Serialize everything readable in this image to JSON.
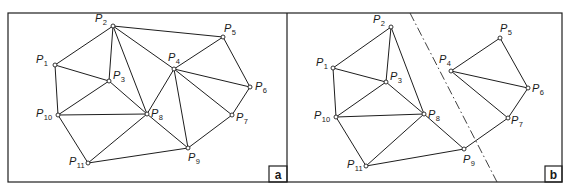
{
  "figure": {
    "colors": {
      "ink": "#1e1e1e",
      "background": "#ffffff"
    },
    "frame": {
      "left": 8,
      "top": 13,
      "right": 562,
      "bottom": 182,
      "divider_x": 287
    },
    "panels": [
      {
        "id": "a",
        "tag": "a",
        "tag_box": {
          "x": 269,
          "y": 166,
          "w": 18,
          "h": 16
        },
        "points": [
          {
            "id": "P1",
            "base": "P",
            "sub": "1",
            "x": 55,
            "y": 65,
            "lx": 36,
            "ly": 63
          },
          {
            "id": "P2",
            "base": "P",
            "sub": "2",
            "x": 113,
            "y": 26,
            "lx": 95,
            "ly": 22
          },
          {
            "id": "P3",
            "base": "P",
            "sub": "3",
            "x": 109,
            "y": 81,
            "lx": 113,
            "ly": 79
          },
          {
            "id": "P4",
            "base": "P",
            "sub": "4",
            "x": 174,
            "y": 69,
            "lx": 168,
            "ly": 61
          },
          {
            "id": "P5",
            "base": "P",
            "sub": "5",
            "x": 223,
            "y": 37,
            "lx": 224,
            "ly": 32
          },
          {
            "id": "P6",
            "base": "P",
            "sub": "6",
            "x": 250,
            "y": 87,
            "lx": 255,
            "ly": 90
          },
          {
            "id": "P7",
            "base": "P",
            "sub": "7",
            "x": 232,
            "y": 115,
            "lx": 236,
            "ly": 121
          },
          {
            "id": "P8",
            "base": "P",
            "sub": "8",
            "x": 147,
            "y": 114,
            "lx": 151,
            "ly": 117
          },
          {
            "id": "P9",
            "base": "P",
            "sub": "9",
            "x": 188,
            "y": 148,
            "lx": 188,
            "ly": 161
          },
          {
            "id": "P10",
            "base": "P",
            "sub": "10",
            "x": 58,
            "y": 115,
            "lx": 36,
            "ly": 117
          },
          {
            "id": "P11",
            "base": "P",
            "sub": "11",
            "x": 88,
            "y": 163,
            "lx": 69,
            "ly": 165
          }
        ],
        "edges": [
          [
            "P1",
            "P2"
          ],
          [
            "P2",
            "P5"
          ],
          [
            "P5",
            "P6"
          ],
          [
            "P6",
            "P7"
          ],
          [
            "P7",
            "P9"
          ],
          [
            "P9",
            "P11"
          ],
          [
            "P11",
            "P10"
          ],
          [
            "P10",
            "P1"
          ],
          [
            "P1",
            "P3"
          ],
          [
            "P2",
            "P3"
          ],
          [
            "P3",
            "P10"
          ],
          [
            "P3",
            "P8"
          ],
          [
            "P2",
            "P8"
          ],
          [
            "P2",
            "P4"
          ],
          [
            "P4",
            "P5"
          ],
          [
            "P4",
            "P6"
          ],
          [
            "P4",
            "P7"
          ],
          [
            "P4",
            "P9"
          ],
          [
            "P4",
            "P8"
          ],
          [
            "P8",
            "P10"
          ],
          [
            "P8",
            "P11"
          ],
          [
            "P8",
            "P9"
          ]
        ]
      },
      {
        "id": "b",
        "tag": "b",
        "tag_box": {
          "x": 545,
          "y": 166,
          "w": 17,
          "h": 16
        },
        "cut_line": {
          "x1": 410,
          "y1": 13,
          "x2": 497,
          "y2": 182
        },
        "points": [
          {
            "id": "P1",
            "base": "P",
            "sub": "1",
            "x": 333,
            "y": 68,
            "lx": 316,
            "ly": 66
          },
          {
            "id": "P2",
            "base": "P",
            "sub": "2",
            "x": 391,
            "y": 27,
            "lx": 373,
            "ly": 23
          },
          {
            "id": "P3",
            "base": "P",
            "sub": "3",
            "x": 386,
            "y": 82,
            "lx": 390,
            "ly": 80
          },
          {
            "id": "P4",
            "base": "P",
            "sub": "4",
            "x": 451,
            "y": 71,
            "lx": 439,
            "ly": 63
          },
          {
            "id": "P5",
            "base": "P",
            "sub": "5",
            "x": 500,
            "y": 38,
            "lx": 500,
            "ly": 32
          },
          {
            "id": "P6",
            "base": "P",
            "sub": "6",
            "x": 528,
            "y": 88,
            "lx": 532,
            "ly": 92
          },
          {
            "id": "P7",
            "base": "P",
            "sub": "7",
            "x": 508,
            "y": 118,
            "lx": 511,
            "ly": 124
          },
          {
            "id": "P8",
            "base": "P",
            "sub": "8",
            "x": 424,
            "y": 114,
            "lx": 428,
            "ly": 118
          },
          {
            "id": "P9",
            "base": "P",
            "sub": "9",
            "x": 464,
            "y": 149,
            "lx": 463,
            "ly": 163
          },
          {
            "id": "P10",
            "base": "P",
            "sub": "10",
            "x": 336,
            "y": 117,
            "lx": 314,
            "ly": 119
          },
          {
            "id": "P11",
            "base": "P",
            "sub": "11",
            "x": 366,
            "y": 166,
            "lx": 347,
            "ly": 168
          }
        ],
        "edges": [
          [
            "P1",
            "P2"
          ],
          [
            "P2",
            "P3"
          ],
          [
            "P1",
            "P3"
          ],
          [
            "P1",
            "P10"
          ],
          [
            "P3",
            "P10"
          ],
          [
            "P3",
            "P8"
          ],
          [
            "P2",
            "P8"
          ],
          [
            "P10",
            "P8"
          ],
          [
            "P10",
            "P11"
          ],
          [
            "P11",
            "P8"
          ],
          [
            "P11",
            "P9"
          ],
          [
            "P8",
            "P9"
          ],
          [
            "P9",
            "P7"
          ],
          [
            "P7",
            "P6"
          ],
          [
            "P6",
            "P5"
          ],
          [
            "P5",
            "P4"
          ],
          [
            "P4",
            "P6"
          ],
          [
            "P4",
            "P7"
          ]
        ]
      }
    ]
  }
}
